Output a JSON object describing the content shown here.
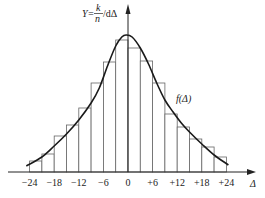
{
  "chart_data": {
    "type": "bar",
    "subtype": "histogram-with-density-curve",
    "title": "",
    "xlabel": "Δ",
    "ylabel": "Y = (k/n)/dΔ",
    "ylabel_parts": {
      "prefix": "Y=",
      "num": "k",
      "den": "n",
      "suffix": "/dΔ"
    },
    "x_ticks": [
      -24,
      -18,
      -12,
      -6,
      0,
      6,
      12,
      18,
      24
    ],
    "x_tick_labels": [
      "−24",
      "−18",
      "−12",
      "−6",
      "0",
      "+6",
      "+12",
      "+18",
      "+24"
    ],
    "bin_width": 3,
    "bin_edges": [
      -24,
      -21,
      -18,
      -15,
      -12,
      -9,
      -6,
      -3,
      0,
      3,
      6,
      9,
      12,
      15,
      18,
      21,
      24
    ],
    "values": [
      11,
      18,
      36,
      47,
      64,
      89,
      110,
      132,
      124,
      111,
      89,
      58,
      45,
      33,
      25,
      15
    ],
    "curve": {
      "label": "f(Δ)",
      "description": "smooth density curve peaking near Δ=0",
      "peak": {
        "x": -0.5,
        "y": 137
      }
    },
    "xlim": [
      -26,
      29
    ],
    "grid": false,
    "legend": "none"
  }
}
